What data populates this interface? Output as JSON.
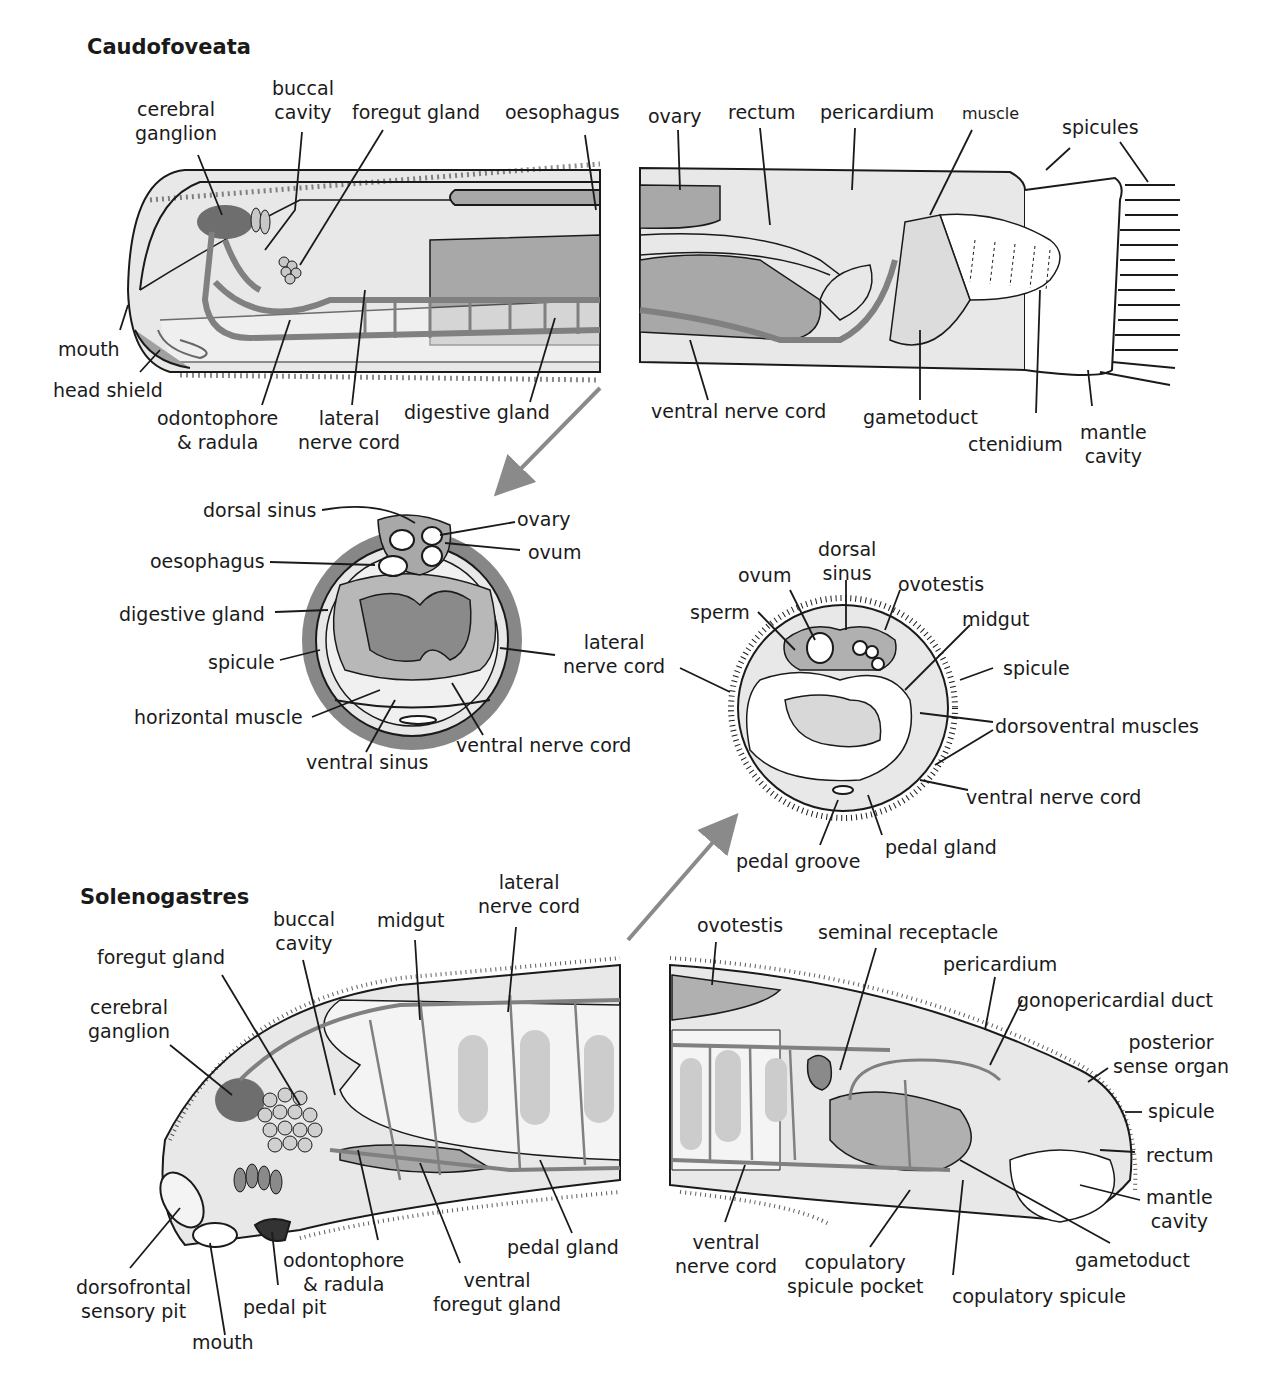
{
  "figure": {
    "colors": {
      "body_fill": "#e8e8e8",
      "light_fill": "#f4f4f4",
      "organ_fill": "#a8a8a8",
      "dark_fill": "#6e6e6e",
      "nerve": "#808080",
      "line": "#1a1a1a",
      "arrow": "#8a8a8a",
      "spicule_gray": "#7a7a7a"
    }
  },
  "caudofoveata": {
    "title": "Caudofoveata",
    "labels": {
      "cerebral_ganglion": [
        "cerebral",
        "ganglion"
      ],
      "buccal_cavity": [
        "buccal",
        "cavity"
      ],
      "foregut_gland": "foregut gland",
      "oesophagus": "oesophagus",
      "ovary": "ovary",
      "rectum": "rectum",
      "pericardium": "pericardium",
      "muscle": "muscle",
      "spicules": "spicules",
      "mouth": "mouth",
      "head_shield": "head shield",
      "odontophore_radula": [
        "odontophore",
        "& radula"
      ],
      "lateral_nerve_cord": [
        "lateral",
        "nerve cord"
      ],
      "digestive_gland": "digestive gland",
      "ventral_nerve_cord": "ventral nerve cord",
      "gametoduct": "gametoduct",
      "ctenidium": "ctenidium",
      "mantle_cavity": [
        "mantle",
        "cavity"
      ]
    },
    "cross_section": {
      "dorsal_sinus": "dorsal sinus",
      "ovary": "ovary",
      "ovum": "ovum",
      "oesophagus": "oesophagus",
      "digestive_gland": "digestive gland",
      "spicule": "spicule",
      "lateral_nerve_cord": [
        "lateral",
        "nerve cord"
      ],
      "horizontal_muscle": "horizontal muscle",
      "ventral_sinus": "ventral sinus",
      "ventral_nerve_cord": "ventral nerve cord"
    }
  },
  "solenogastres": {
    "title": "Solenogastres",
    "cross_section": {
      "dorsal_sinus": [
        "dorsal",
        "sinus"
      ],
      "ovum": "ovum",
      "ovotestis": "ovotestis",
      "sperm": "sperm",
      "midgut": "midgut",
      "spicule": "spicule",
      "dorsoventral_muscles": "dorsoventral muscles",
      "ventral_nerve_cord": "ventral nerve cord",
      "pedal_gland": "pedal gland",
      "pedal_groove": "pedal groove"
    },
    "labels": {
      "lateral_nerve_cord": [
        "lateral",
        "nerve cord"
      ],
      "buccal_cavity": [
        "buccal",
        "cavity"
      ],
      "midgut": "midgut",
      "foregut_gland": "foregut gland",
      "cerebral_ganglion": [
        "cerebral",
        "ganglion"
      ],
      "pedal_gland": "pedal gland",
      "odontophore_radula": [
        "odontophore",
        "& radula"
      ],
      "ventral_foregut_gland": [
        "ventral",
        "foregut gland"
      ],
      "dorsofrontal_sensory_pit": [
        "dorsofrontal",
        "sensory pit"
      ],
      "pedal_pit": "pedal pit",
      "mouth": "mouth",
      "ovotestis": "ovotestis",
      "seminal_receptacle": "seminal receptacle",
      "pericardium": "pericardium",
      "gonopericardial_duct": "gonopericardial duct",
      "posterior_sense_organ": [
        "posterior",
        "sense organ"
      ],
      "spicule": "spicule",
      "rectum": "rectum",
      "mantle_cavity": [
        "mantle",
        "cavity"
      ],
      "gametoduct": "gametoduct",
      "ventral_nerve_cord": [
        "ventral",
        "nerve cord"
      ],
      "copulatory_spicule_pocket": [
        "copulatory",
        "spicule pocket"
      ],
      "copulatory_spicule": "copulatory spicule"
    }
  }
}
